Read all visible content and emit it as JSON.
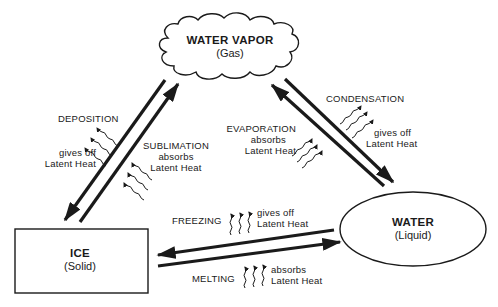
{
  "nodes": {
    "vapor": {
      "title": "WATER VAPOR",
      "state": "(Gas)"
    },
    "water": {
      "title": "WATER",
      "state": "(Liquid)"
    },
    "ice": {
      "title": "ICE",
      "state": "(Solid)"
    }
  },
  "processes": {
    "deposition": {
      "name": "DEPOSITION",
      "heat_line1": "gives off",
      "heat_line2": "Latent Heat"
    },
    "sublimation": {
      "name": "SUBLIMATION",
      "heat_line1": "absorbs",
      "heat_line2": "Latent Heat"
    },
    "evaporation": {
      "name": "EVAPORATION",
      "heat_line1": "absorbs",
      "heat_line2": "Latent Heat"
    },
    "condensation": {
      "name": "CONDENSATION",
      "heat_line1": "gives off",
      "heat_line2": "Latent Heat"
    },
    "freezing": {
      "name": "FREEZING",
      "heat_line1": "gives off",
      "heat_line2": "Latent Heat"
    },
    "melting": {
      "name": "MELTING",
      "heat_line1": "absorbs",
      "heat_line2": "Latent Heat"
    }
  },
  "colors": {
    "ink": "#1a1a1a",
    "background": "#ffffff"
  }
}
